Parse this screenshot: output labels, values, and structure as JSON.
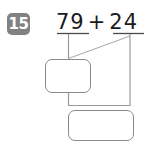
{
  "problem": {
    "number_label": "15",
    "equation": {
      "left_addend": "79",
      "operator": "+",
      "right_addend": "24",
      "full_text": "79 + 24"
    },
    "answer_boxes": [
      {
        "name": "partial-sum",
        "value": "",
        "placeholder": ""
      },
      {
        "name": "total-sum",
        "value": "",
        "placeholder": ""
      }
    ],
    "colors": {
      "badge_background": "#828282",
      "badge_text": "#ffffff",
      "equation_text": "#1b1b1b",
      "line_stroke": "#9a9a9a",
      "box_border": "#8a8a8a",
      "underline_stroke": "#4a4a4a",
      "page_background": "#ffffff"
    }
  }
}
